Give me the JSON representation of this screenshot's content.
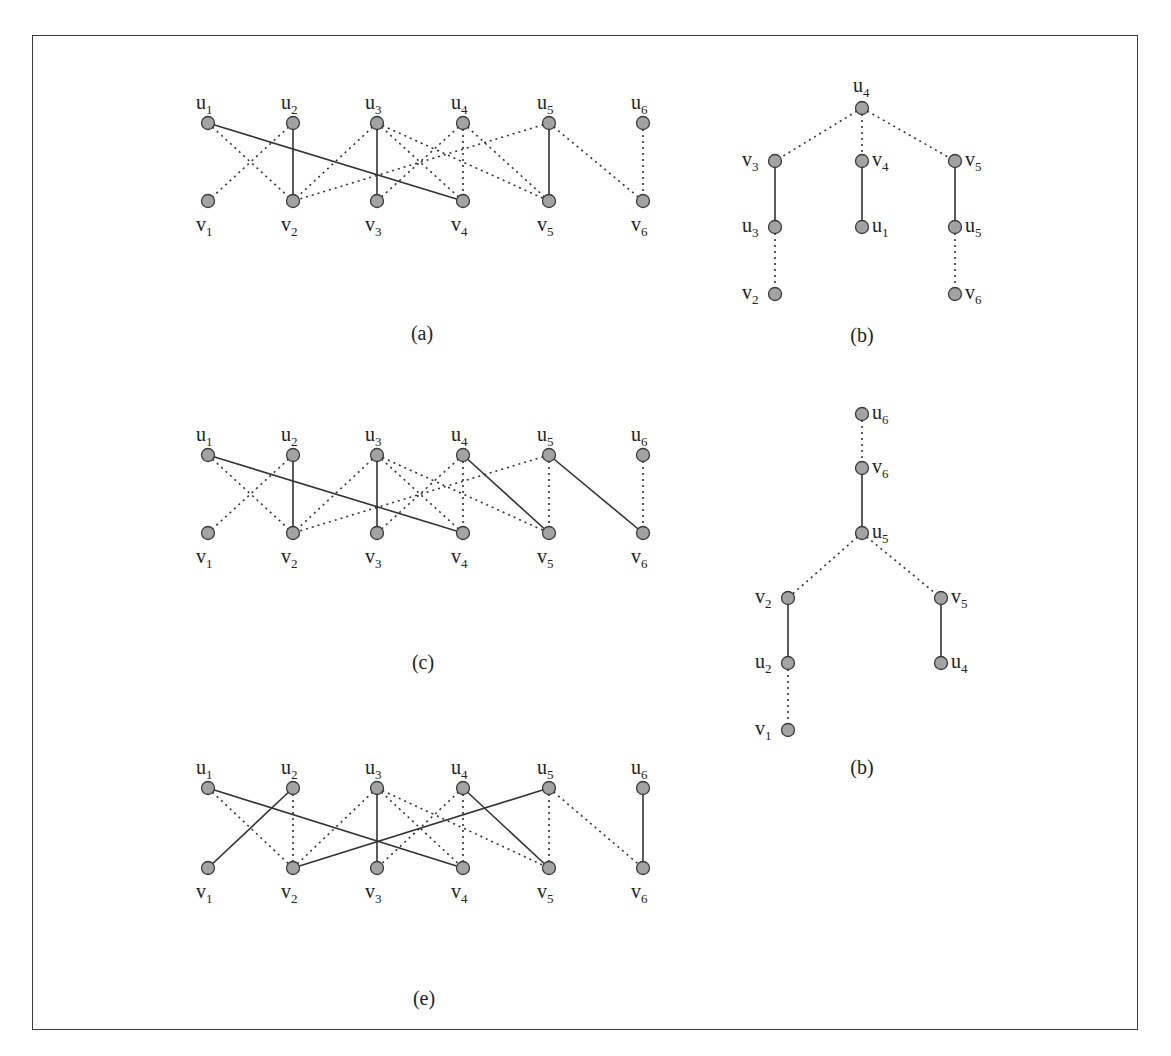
{
  "figure": {
    "frame_color": "#3a3a3a",
    "node_fill": "#a3a3a3",
    "bipartite_graphs": [
      {
        "id": "a",
        "caption": "(a)",
        "caption_pos": [
          422,
          340
        ],
        "u_y": 123,
        "v_y": 201,
        "xs": [
          208,
          293,
          377,
          463,
          549,
          643
        ],
        "u_labels": [
          "u1",
          "u2",
          "u3",
          "u4",
          "u5",
          "u6"
        ],
        "v_labels": [
          "v1",
          "v2",
          "v3",
          "v4",
          "v5",
          "v6"
        ],
        "edges": [
          {
            "u": 1,
            "v": 4,
            "style": "solid"
          },
          {
            "u": 1,
            "v": 2,
            "style": "dotted"
          },
          {
            "u": 2,
            "v": 1,
            "style": "dotted"
          },
          {
            "u": 2,
            "v": 2,
            "style": "solid"
          },
          {
            "u": 3,
            "v": 2,
            "style": "dotted"
          },
          {
            "u": 3,
            "v": 3,
            "style": "solid"
          },
          {
            "u": 3,
            "v": 4,
            "style": "dotted"
          },
          {
            "u": 3,
            "v": 5,
            "style": "dotted"
          },
          {
            "u": 4,
            "v": 3,
            "style": "dotted"
          },
          {
            "u": 4,
            "v": 4,
            "style": "dotted"
          },
          {
            "u": 4,
            "v": 5,
            "style": "dotted"
          },
          {
            "u": 5,
            "v": 2,
            "style": "dotted"
          },
          {
            "u": 5,
            "v": 5,
            "style": "solid"
          },
          {
            "u": 5,
            "v": 6,
            "style": "dotted"
          },
          {
            "u": 6,
            "v": 6,
            "style": "dotted"
          }
        ]
      },
      {
        "id": "c",
        "caption": "(c)",
        "caption_pos": [
          423,
          669
        ],
        "u_y": 455,
        "v_y": 533,
        "xs": [
          208,
          293,
          377,
          463,
          549,
          643
        ],
        "u_labels": [
          "u1",
          "u2",
          "u3",
          "u4",
          "u5",
          "u6"
        ],
        "v_labels": [
          "v1",
          "v2",
          "v3",
          "v4",
          "v5",
          "v6"
        ],
        "edges": [
          {
            "u": 1,
            "v": 4,
            "style": "solid"
          },
          {
            "u": 1,
            "v": 2,
            "style": "dotted"
          },
          {
            "u": 2,
            "v": 1,
            "style": "dotted"
          },
          {
            "u": 2,
            "v": 2,
            "style": "solid"
          },
          {
            "u": 3,
            "v": 2,
            "style": "dotted"
          },
          {
            "u": 3,
            "v": 3,
            "style": "solid"
          },
          {
            "u": 3,
            "v": 4,
            "style": "dotted"
          },
          {
            "u": 3,
            "v": 5,
            "style": "dotted"
          },
          {
            "u": 4,
            "v": 3,
            "style": "dotted"
          },
          {
            "u": 4,
            "v": 4,
            "style": "dotted"
          },
          {
            "u": 4,
            "v": 5,
            "style": "solid"
          },
          {
            "u": 5,
            "v": 2,
            "style": "dotted"
          },
          {
            "u": 5,
            "v": 5,
            "style": "dotted"
          },
          {
            "u": 5,
            "v": 6,
            "style": "solid"
          },
          {
            "u": 6,
            "v": 6,
            "style": "dotted"
          }
        ]
      },
      {
        "id": "e",
        "caption": "(e)",
        "caption_pos": [
          424,
          1005
        ],
        "u_y": 788,
        "v_y": 868,
        "xs": [
          208,
          293,
          377,
          463,
          549,
          643
        ],
        "u_labels": [
          "u1",
          "u2",
          "u3",
          "u4",
          "u5",
          "u6"
        ],
        "v_labels": [
          "v1",
          "v2",
          "v3",
          "v4",
          "v5",
          "v6"
        ],
        "edges": [
          {
            "u": 1,
            "v": 4,
            "style": "solid"
          },
          {
            "u": 1,
            "v": 2,
            "style": "dotted"
          },
          {
            "u": 2,
            "v": 1,
            "style": "solid"
          },
          {
            "u": 2,
            "v": 2,
            "style": "dotted"
          },
          {
            "u": 3,
            "v": 2,
            "style": "dotted"
          },
          {
            "u": 3,
            "v": 3,
            "style": "solid"
          },
          {
            "u": 3,
            "v": 4,
            "style": "dotted"
          },
          {
            "u": 3,
            "v": 5,
            "style": "dotted"
          },
          {
            "u": 4,
            "v": 3,
            "style": "dotted"
          },
          {
            "u": 4,
            "v": 4,
            "style": "dotted"
          },
          {
            "u": 4,
            "v": 5,
            "style": "solid"
          },
          {
            "u": 5,
            "v": 2,
            "style": "solid"
          },
          {
            "u": 5,
            "v": 5,
            "style": "dotted"
          },
          {
            "u": 5,
            "v": 6,
            "style": "dotted"
          },
          {
            "u": 6,
            "v": 6,
            "style": "solid"
          }
        ]
      }
    ],
    "trees": [
      {
        "id": "b1",
        "caption": "(b)",
        "caption_pos": [
          862,
          342
        ],
        "nodes": [
          {
            "id": "u4",
            "x": 862,
            "y": 108,
            "label": "u4",
            "label_side": "top"
          },
          {
            "id": "v3",
            "x": 775,
            "y": 161,
            "label": "v3",
            "label_side": "left"
          },
          {
            "id": "v4",
            "x": 862,
            "y": 161,
            "label": "v4",
            "label_side": "right"
          },
          {
            "id": "v5",
            "x": 955,
            "y": 161,
            "label": "v5",
            "label_side": "right"
          },
          {
            "id": "u3",
            "x": 775,
            "y": 227,
            "label": "u3",
            "label_side": "left"
          },
          {
            "id": "u1",
            "x": 862,
            "y": 227,
            "label": "u1",
            "label_side": "right"
          },
          {
            "id": "u5",
            "x": 955,
            "y": 227,
            "label": "u5",
            "label_side": "right"
          },
          {
            "id": "v2",
            "x": 775,
            "y": 294,
            "label": "v2",
            "label_side": "left"
          },
          {
            "id": "v6",
            "x": 955,
            "y": 294,
            "label": "v6",
            "label_side": "right"
          }
        ],
        "edges": [
          {
            "a": "u4",
            "b": "v3",
            "style": "dotted"
          },
          {
            "a": "u4",
            "b": "v4",
            "style": "dotted"
          },
          {
            "a": "u4",
            "b": "v5",
            "style": "dotted"
          },
          {
            "a": "v3",
            "b": "u3",
            "style": "solid"
          },
          {
            "a": "v4",
            "b": "u1",
            "style": "solid"
          },
          {
            "a": "v5",
            "b": "u5",
            "style": "solid"
          },
          {
            "a": "u3",
            "b": "v2",
            "style": "dotted"
          },
          {
            "a": "u5",
            "b": "v6",
            "style": "dotted"
          }
        ]
      },
      {
        "id": "b2",
        "caption": "(b)",
        "caption_pos": [
          862,
          774
        ],
        "nodes": [
          {
            "id": "u6",
            "x": 862,
            "y": 414,
            "label": "u6",
            "label_side": "right"
          },
          {
            "id": "v6",
            "x": 862,
            "y": 468,
            "label": "v6",
            "label_side": "right"
          },
          {
            "id": "u5",
            "x": 862,
            "y": 533,
            "label": "u5",
            "label_side": "right"
          },
          {
            "id": "v2",
            "x": 788,
            "y": 598,
            "label": "v2",
            "label_side": "left"
          },
          {
            "id": "v5",
            "x": 941,
            "y": 598,
            "label": "v5",
            "label_side": "right"
          },
          {
            "id": "u2",
            "x": 788,
            "y": 663,
            "label": "u2",
            "label_side": "left"
          },
          {
            "id": "u4",
            "x": 941,
            "y": 663,
            "label": "u4",
            "label_side": "right"
          },
          {
            "id": "v1",
            "x": 788,
            "y": 730,
            "label": "v1",
            "label_side": "left"
          }
        ],
        "edges": [
          {
            "a": "u6",
            "b": "v6",
            "style": "dotted"
          },
          {
            "a": "v6",
            "b": "u5",
            "style": "solid"
          },
          {
            "a": "u5",
            "b": "v2",
            "style": "dotted"
          },
          {
            "a": "u5",
            "b": "v5",
            "style": "dotted"
          },
          {
            "a": "v2",
            "b": "u2",
            "style": "solid"
          },
          {
            "a": "v5",
            "b": "u4",
            "style": "solid"
          },
          {
            "a": "u2",
            "b": "v1",
            "style": "dotted"
          }
        ]
      }
    ]
  }
}
